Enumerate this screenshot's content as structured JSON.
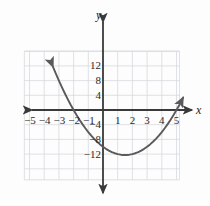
{
  "figure": {
    "background_color": "#fdfdfd",
    "axis_color": "#3a3a3a",
    "grid_color": "#d6d9de",
    "curve_color": "#5a5a5a"
  },
  "axis_labels": {
    "x_name": "x",
    "y_name": "y"
  },
  "chart_data": {
    "type": "line",
    "title": "",
    "subtitle": "",
    "xlabel": "x",
    "ylabel": "y",
    "grid": true,
    "legend": "none",
    "xlim": [
      -5.35,
      5.75
    ],
    "ylim": [
      -19.5,
      16.5
    ],
    "x_ticks": [
      -5,
      -4,
      -3,
      -2,
      -1,
      1,
      2,
      3,
      4,
      5
    ],
    "x_tick_labels": [
      "−5",
      "−4",
      "−3",
      "−2",
      "−1",
      "1",
      "2",
      "3",
      "4",
      "5"
    ],
    "y_ticks": [
      12,
      8,
      4,
      -4,
      -8,
      -12
    ],
    "y_tick_labels": [
      "12",
      "8",
      "4",
      "−4",
      "−8",
      "−12"
    ],
    "x_gridline_step": 1,
    "y_gridline_step": 4,
    "annotations": [
      {
        "label": "left-arrow-end",
        "x": -3.4,
        "y": 13.8
      },
      {
        "label": "right-arrow-end",
        "x": 5.45,
        "y": 5.0
      }
    ],
    "series": [
      {
        "name": "parabola",
        "equation": "y = x^2 - 3x - 10",
        "vertex": [
          1.5,
          -12.25
        ],
        "roots": [
          -2,
          5
        ],
        "y_intercept": -10,
        "x": [
          -3.4,
          -3.2,
          -3.0,
          -2.8,
          -2.6,
          -2.4,
          -2.2,
          -2.0,
          -1.8,
          -1.6,
          -1.4,
          -1.2,
          -1.0,
          -0.8,
          -0.6,
          -0.4,
          -0.2,
          0.0,
          0.2,
          0.4,
          0.6,
          0.8,
          1.0,
          1.2,
          1.4,
          1.5,
          1.6,
          1.8,
          2.0,
          2.2,
          2.4,
          2.6,
          2.8,
          3.0,
          3.2,
          3.4,
          3.6,
          3.8,
          4.0,
          4.2,
          4.4,
          4.6,
          4.8,
          5.0,
          5.2,
          5.45
        ],
        "values": [
          11.76,
          9.84,
          8.0,
          6.24,
          4.56,
          2.96,
          1.44,
          0.0,
          -1.36,
          -2.64,
          -3.84,
          -4.96,
          -6.0,
          -6.96,
          -7.84,
          -8.64,
          -9.36,
          -10.0,
          -10.56,
          -11.04,
          -11.44,
          -11.76,
          -12.0,
          -12.16,
          -12.24,
          -12.25,
          -12.24,
          -12.16,
          -12.0,
          -11.76,
          -11.44,
          -11.04,
          -10.56,
          -10.0,
          -9.36,
          -8.64,
          -7.84,
          -6.96,
          -6.0,
          -4.96,
          -3.84,
          -2.64,
          -1.36,
          0.0,
          1.44,
          3.39
        ]
      }
    ]
  }
}
